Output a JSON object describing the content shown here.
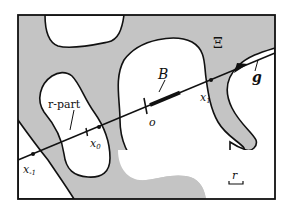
{
  "colors": {
    "background": "#ffffff",
    "grey_region": "#c4c4c4",
    "stroke": "#111111"
  },
  "labels": {
    "region": "Ξ",
    "r_part": "r-part",
    "segment": "B",
    "origin": "o",
    "x1": "x",
    "x1_sub": "1",
    "x0": "x",
    "x0_sub": "0",
    "xm1": "x",
    "xm1_sub": "-1",
    "direction": "g",
    "scale": "r"
  },
  "icons": {
    "arrowhead": "arrow-right-icon",
    "scale_bar": "scale-bar-icon"
  }
}
